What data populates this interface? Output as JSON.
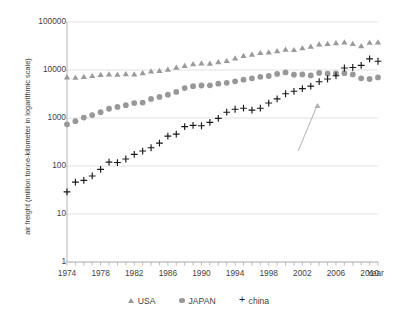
{
  "chart_data": {
    "type": "scatter",
    "title": "",
    "xlabel": "Year",
    "ylabel": "air freight (million tonne-kilometer in logarithmic scale)",
    "yscale": "log",
    "ylim": [
      1,
      100000
    ],
    "xlim": [
      1974,
      2011
    ],
    "ytick_labels": [
      "100000",
      "10000",
      "1000",
      "100",
      "10",
      "1"
    ],
    "ytick_values": [
      100000,
      10000,
      1000,
      100,
      10,
      1
    ],
    "xtick_labels": [
      "1974",
      "1978",
      "1982",
      "1986",
      "1990",
      "1994",
      "1998",
      "2002",
      "2006",
      "2010"
    ],
    "xtick_values": [
      1974,
      1978,
      1982,
      1986,
      1990,
      1994,
      1998,
      2002,
      2006,
      2010
    ],
    "grid": true,
    "legend_position": "bottom",
    "x": [
      1974,
      1975,
      1976,
      1977,
      1978,
      1979,
      1980,
      1981,
      1982,
      1983,
      1984,
      1985,
      1986,
      1987,
      1988,
      1989,
      1990,
      1991,
      1992,
      1993,
      1994,
      1995,
      1996,
      1997,
      1998,
      1999,
      2000,
      2001,
      2002,
      2003,
      2004,
      2005,
      2006,
      2007,
      2008,
      2009,
      2010,
      2011
    ],
    "series": [
      {
        "name": "USA",
        "marker": "triangle",
        "color": "#9a9a9a",
        "values": [
          7000,
          6900,
          7200,
          7500,
          7900,
          8100,
          8000,
          8200,
          8100,
          8600,
          9400,
          9600,
          10200,
          11200,
          12200,
          13200,
          13800,
          13600,
          14600,
          15400,
          17400,
          19700,
          21000,
          22600,
          23400,
          24700,
          26500,
          26100,
          28400,
          30800,
          34200,
          35000,
          36400,
          37500,
          35000,
          31500,
          37000,
          37500
        ]
      },
      {
        "name": "JAPAN",
        "marker": "circle",
        "color": "#989898",
        "values": [
          740,
          860,
          1020,
          1150,
          1320,
          1560,
          1700,
          1850,
          2050,
          2100,
          2500,
          2750,
          3050,
          3500,
          4200,
          4600,
          4750,
          4800,
          5200,
          5400,
          5800,
          6300,
          6700,
          7200,
          7500,
          8300,
          8900,
          8000,
          8100,
          7700,
          8700,
          8400,
          8500,
          8600,
          8100,
          6700,
          6500,
          7000
        ]
      },
      {
        "name": "china",
        "marker": "plus",
        "color": "#1a1a1a",
        "values": [
          29,
          46,
          50,
          62,
          85,
          120,
          118,
          140,
          175,
          205,
          240,
          300,
          420,
          460,
          660,
          700,
          690,
          810,
          980,
          1320,
          1520,
          1600,
          1460,
          1600,
          2050,
          2500,
          3200,
          3600,
          4100,
          4600,
          5700,
          6500,
          7600,
          11000,
          11300,
          12500,
          17000,
          15200
        ]
      }
    ],
    "annotations": [
      {
        "name": "leader-line",
        "type": "line",
        "from": [
          2001.5,
          205
        ],
        "to": [
          2003.8,
          1900
        ]
      },
      {
        "name": "usa-outlier-marker",
        "type": "triangle",
        "at": [
          2003.8,
          1780
        ],
        "color": "#b0b0b0"
      }
    ]
  },
  "legend": {
    "items": [
      {
        "label": "USA",
        "symbol": "triangle-marker"
      },
      {
        "label": "JAPAN",
        "symbol": "circle-marker"
      },
      {
        "label": "china",
        "symbol": "plus-marker"
      }
    ]
  }
}
